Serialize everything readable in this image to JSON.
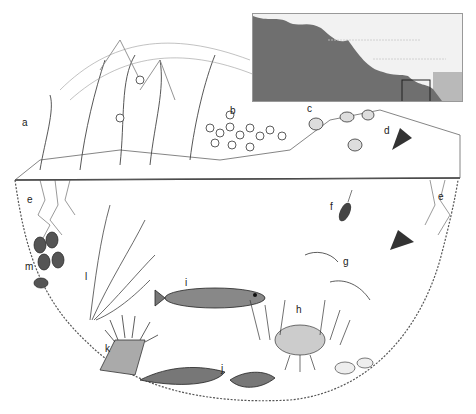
{
  "figure": {
    "inset": {
      "rock_color": "#6f6f6f",
      "sky_color": "#f2f2f2",
      "sea_color": "#b9b9b9",
      "highlight_box": "rock pool location"
    },
    "labels": [
      {
        "letter": "a",
        "x": 22,
        "y": 126,
        "subject": "seaweed (wrack) on rock top"
      },
      {
        "letter": "b",
        "x": 230,
        "y": 114,
        "subject": "barnacles"
      },
      {
        "letter": "c",
        "x": 307,
        "y": 112,
        "subject": "periwinkles / snails"
      },
      {
        "letter": "d",
        "x": 384,
        "y": 134,
        "subject": "limpet"
      },
      {
        "letter": "e",
        "x": 27,
        "y": 203,
        "subject": "coralline / encrusting weed (left)"
      },
      {
        "letter": "e",
        "x": 438,
        "y": 200,
        "subject": "coralline / encrusting weed (right)"
      },
      {
        "letter": "f",
        "x": 330,
        "y": 210,
        "subject": "sea slater / isopod"
      },
      {
        "letter": "g",
        "x": 343,
        "y": 265,
        "subject": "prawns / shrimps"
      },
      {
        "letter": "h",
        "x": 296,
        "y": 313,
        "subject": "hermit crab with anemones"
      },
      {
        "letter": "i",
        "x": 185,
        "y": 286,
        "subject": "goby fish"
      },
      {
        "letter": "j",
        "x": 221,
        "y": 372,
        "subject": "blenny on pool floor"
      },
      {
        "letter": "k",
        "x": 105,
        "y": 352,
        "subject": "beadlet anemone"
      },
      {
        "letter": "l",
        "x": 85,
        "y": 280,
        "subject": "kelp / seaweed fronds"
      },
      {
        "letter": "m",
        "x": 25,
        "y": 270,
        "subject": "mussels"
      }
    ]
  }
}
